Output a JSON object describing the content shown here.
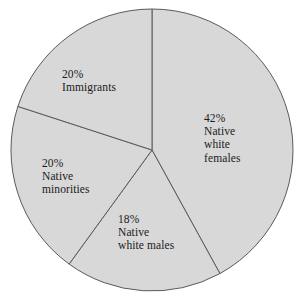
{
  "chart_data": {
    "type": "pie",
    "title": "",
    "subtitle": "",
    "xlabel": "",
    "ylabel": "",
    "legend_position": "none",
    "grid": false,
    "start_angle_deg": 0,
    "direction": "clockwise",
    "categories": [
      "Native white females",
      "Native white males",
      "Native minorities",
      "Immigrants"
    ],
    "values": [
      42,
      18,
      20,
      20
    ],
    "value_unit": "%",
    "slices": [
      {
        "id": "native-white-females",
        "percent": 42,
        "percent_label": "42%",
        "name_lines": [
          "Native",
          "white",
          "females"
        ],
        "label_lines": [
          "42%",
          "Native",
          "white",
          "females"
        ],
        "start_deg": 0,
        "end_deg": 151.2,
        "fill": "#d8d8d8",
        "stroke": "#5a5a5a"
      },
      {
        "id": "native-white-males",
        "percent": 18,
        "percent_label": "18%",
        "name_lines": [
          "Native",
          "white males"
        ],
        "label_lines": [
          "18%",
          "Native",
          "white males"
        ],
        "start_deg": 151.2,
        "end_deg": 216,
        "fill": "#d8d8d8",
        "stroke": "#5a5a5a"
      },
      {
        "id": "native-minorities",
        "percent": 20,
        "percent_label": "20%",
        "name_lines": [
          "Native",
          "minorities"
        ],
        "label_lines": [
          "20%",
          "Native",
          "minorities"
        ],
        "start_deg": 216,
        "end_deg": 288,
        "fill": "#d8d8d8",
        "stroke": "#5a5a5a"
      },
      {
        "id": "immigrants",
        "percent": 20,
        "percent_label": "20%",
        "name_lines": [
          "Immigrants"
        ],
        "label_lines": [
          "20%",
          "Immigrants"
        ],
        "start_deg": 288,
        "end_deg": 360,
        "fill": "#d8d8d8",
        "stroke": "#5a5a5a"
      }
    ]
  },
  "labels": {
    "native_white_females": {
      "line1": "42%",
      "line2": "Native",
      "line3": "white",
      "line4": "females"
    },
    "immigrants": {
      "line1": "20%",
      "line2": "Immigrants"
    },
    "native_minorities": {
      "line1": "20%",
      "line2": "Native",
      "line3": "minorities"
    },
    "native_white_males": {
      "line1": "18%",
      "line2": "Native",
      "line3": "white males"
    }
  },
  "colors": {
    "slice_fill": "#d8d8d8",
    "slice_stroke": "#5a5a5a",
    "text": "#1b1b1b",
    "background": "#ffffff"
  },
  "geometry": {
    "center_x": 152,
    "center_y": 150,
    "radius": 141
  }
}
